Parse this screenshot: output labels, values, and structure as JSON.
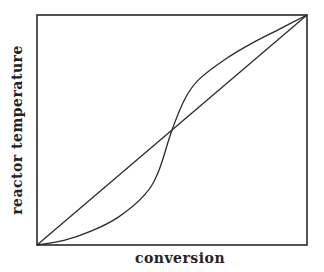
{
  "chart_data": {
    "type": "line",
    "title": "",
    "xlabel": "conversion",
    "ylabel": "reactor temperature",
    "xlim": [
      0,
      1
    ],
    "ylim": [
      0,
      1
    ],
    "grid": false,
    "ticks": false,
    "legend": null,
    "series": [
      {
        "name": "straight line (diagonal)",
        "style": "line",
        "x": [
          0,
          1
        ],
        "y": [
          0,
          1
        ]
      },
      {
        "name": "S-shaped curve",
        "style": "curve",
        "x": [
          0,
          0.1,
          0.2,
          0.3,
          0.4,
          0.45,
          0.5,
          0.55,
          0.6,
          0.7,
          0.8,
          0.9,
          1.0
        ],
        "y": [
          0,
          0.02,
          0.06,
          0.12,
          0.22,
          0.32,
          0.5,
          0.64,
          0.72,
          0.81,
          0.88,
          0.94,
          1.0
        ]
      }
    ],
    "annotations": [
      {
        "text": "curves intersect near midpoint",
        "x": 0.53,
        "y": 0.53
      }
    ],
    "colors": {
      "line": "#2a2a2a",
      "background": "#ffffff"
    }
  },
  "labels": {
    "x": "conversion",
    "y": "reactor temperature"
  }
}
